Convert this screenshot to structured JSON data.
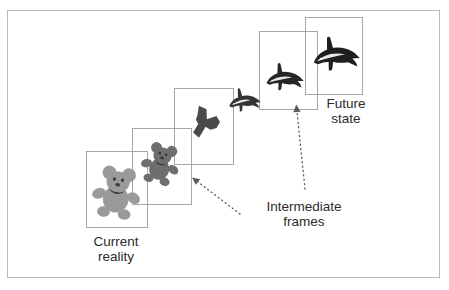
{
  "diagram": {
    "background_color": "#ffffff",
    "border_color": "#b9b9b9",
    "frame_border_color": "#a7a7a7",
    "label_color": "#2b2b2b",
    "bear_color": "#9a9a9a",
    "dolphin_color": "#1f1f1f",
    "morph_mid_color": "#4a4a4a",
    "arrow_color": "#595959"
  },
  "labels": {
    "current_reality": "Current\nreality",
    "intermediate_frames": "Intermediate\nframes",
    "future_state": "Future\nstate"
  },
  "frames": [
    {
      "id": "frame-1",
      "stage": "current-reality",
      "subject": "teddy-bear",
      "x": 86,
      "y": 151,
      "w": 62,
      "h": 77
    },
    {
      "id": "frame-2",
      "stage": "intermediate-1",
      "subject": "bear-morph-1",
      "x": 132,
      "y": 128,
      "w": 60,
      "h": 77
    },
    {
      "id": "frame-3",
      "stage": "intermediate-2",
      "subject": "bear-dolphin-blend",
      "x": 174,
      "y": 88,
      "w": 60,
      "h": 77
    },
    {
      "id": "frame-4",
      "stage": "intermediate-3",
      "subject": "dolphin-morph",
      "x": 259,
      "y": 31,
      "w": 59,
      "h": 79
    },
    {
      "id": "frame-5",
      "stage": "future-state",
      "subject": "dolphin",
      "x": 305,
      "y": 17,
      "w": 58,
      "h": 78
    }
  ],
  "subjects": [
    {
      "id": "subject-1",
      "name": "teddy-bear",
      "x": 88,
      "y": 161,
      "size": 58,
      "color": "#9a9a9a"
    },
    {
      "id": "subject-2",
      "name": "bear-morph-1",
      "x": 138,
      "y": 139,
      "size": 46,
      "color": "#6e6e6e"
    },
    {
      "id": "subject-3",
      "name": "bear-dolphin-blend",
      "x": 186,
      "y": 103,
      "size": 38,
      "color": "#4a4a4a"
    },
    {
      "id": "subject-4",
      "name": "dolphin-morph-1",
      "x": 225,
      "y": 82,
      "size": 36,
      "color": "#333333"
    },
    {
      "id": "subject-5",
      "name": "dolphin-morph-2",
      "x": 262,
      "y": 56,
      "size": 42,
      "color": "#262626"
    },
    {
      "id": "subject-6",
      "name": "dolphin",
      "x": 308,
      "y": 28,
      "size": 52,
      "color": "#1f1f1f"
    }
  ],
  "label_positions": {
    "current_reality": {
      "x": 74,
      "y": 234,
      "w": 84
    },
    "intermediate_frames": {
      "x": 245,
      "y": 199,
      "w": 118
    },
    "future_state": {
      "x": 310,
      "y": 96,
      "w": 72
    }
  },
  "arrows": [
    {
      "id": "arrow-intermediate",
      "name": "dotted-arrow-to-frames",
      "x1": 240,
      "y1": 214,
      "x2": 198,
      "y2": 182
    },
    {
      "id": "arrow-future",
      "name": "dotted-arrow-to-future-frame",
      "x1": 305,
      "y1": 189,
      "x2": 297,
      "y2": 112
    }
  ]
}
